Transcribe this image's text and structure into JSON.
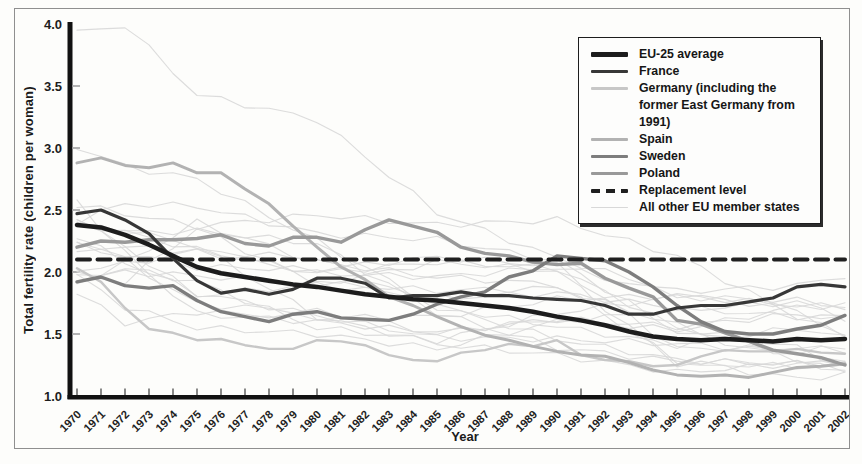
{
  "figure": {
    "background": "#fdfdfb",
    "border_color": "#8f8f8f"
  },
  "chart_data": {
    "type": "line",
    "title": "",
    "xlabel": "Year",
    "ylabel": "Total fertility rate (children per woman)",
    "xlim": [
      1970,
      2002
    ],
    "ylim": [
      1.0,
      4.0
    ],
    "y_ticks": [
      1.0,
      1.5,
      2.0,
      2.5,
      3.0,
      3.5,
      4.0
    ],
    "grid": false,
    "legend_position": "top-right",
    "years": [
      1970,
      1971,
      1972,
      1973,
      1974,
      1975,
      1976,
      1977,
      1978,
      1979,
      1980,
      1981,
      1982,
      1983,
      1984,
      1985,
      1986,
      1987,
      1988,
      1989,
      1990,
      1991,
      1992,
      1993,
      1994,
      1995,
      1996,
      1997,
      1998,
      1999,
      2000,
      2001,
      2002
    ],
    "series": [
      {
        "name": "EU-25 average",
        "color": "#1c1c1c",
        "width": 4.5,
        "values": [
          2.38,
          2.36,
          2.3,
          2.22,
          2.13,
          2.04,
          1.99,
          1.96,
          1.93,
          1.9,
          1.88,
          1.85,
          1.82,
          1.8,
          1.78,
          1.77,
          1.75,
          1.73,
          1.71,
          1.68,
          1.64,
          1.61,
          1.57,
          1.52,
          1.48,
          1.46,
          1.45,
          1.46,
          1.45,
          1.44,
          1.46,
          1.45,
          1.46
        ]
      },
      {
        "name": "France",
        "color": "#373737",
        "width": 3.2,
        "values": [
          2.47,
          2.5,
          2.42,
          2.31,
          2.11,
          1.93,
          1.83,
          1.86,
          1.82,
          1.86,
          1.95,
          1.95,
          1.91,
          1.79,
          1.81,
          1.81,
          1.84,
          1.81,
          1.81,
          1.79,
          1.78,
          1.77,
          1.73,
          1.66,
          1.66,
          1.71,
          1.73,
          1.73,
          1.76,
          1.79,
          1.88,
          1.9,
          1.88
        ]
      },
      {
        "name": "Germany (including the former East Germany from 1991)",
        "color": "#c7c7c7",
        "width": 2.4,
        "values": [
          2.03,
          1.92,
          1.71,
          1.54,
          1.51,
          1.45,
          1.46,
          1.41,
          1.38,
          1.38,
          1.45,
          1.44,
          1.41,
          1.33,
          1.29,
          1.28,
          1.35,
          1.37,
          1.42,
          1.4,
          1.45,
          1.33,
          1.29,
          1.28,
          1.24,
          1.25,
          1.32,
          1.37,
          1.36,
          1.36,
          1.38,
          1.35,
          1.34
        ]
      },
      {
        "name": "Spain",
        "color": "#b2b2b2",
        "width": 3.0,
        "values": [
          2.88,
          2.92,
          2.86,
          2.84,
          2.88,
          2.8,
          2.8,
          2.67,
          2.55,
          2.37,
          2.2,
          2.04,
          1.94,
          1.8,
          1.73,
          1.64,
          1.56,
          1.49,
          1.45,
          1.4,
          1.36,
          1.33,
          1.32,
          1.27,
          1.21,
          1.17,
          1.16,
          1.17,
          1.15,
          1.19,
          1.23,
          1.24,
          1.26
        ]
      },
      {
        "name": "Sweden",
        "color": "#7d7d7d",
        "width": 3.4,
        "values": [
          1.92,
          1.96,
          1.89,
          1.87,
          1.89,
          1.77,
          1.68,
          1.64,
          1.6,
          1.66,
          1.68,
          1.63,
          1.62,
          1.61,
          1.66,
          1.74,
          1.8,
          1.84,
          1.96,
          2.01,
          2.13,
          2.11,
          2.09,
          2.0,
          1.88,
          1.73,
          1.6,
          1.52,
          1.5,
          1.5,
          1.54,
          1.57,
          1.65
        ]
      },
      {
        "name": "Poland",
        "color": "#999999",
        "width": 3.4,
        "values": [
          2.2,
          2.25,
          2.24,
          2.26,
          2.26,
          2.27,
          2.3,
          2.23,
          2.21,
          2.28,
          2.28,
          2.24,
          2.34,
          2.42,
          2.37,
          2.32,
          2.2,
          2.15,
          2.13,
          2.08,
          2.06,
          2.07,
          1.95,
          1.87,
          1.8,
          1.61,
          1.58,
          1.51,
          1.44,
          1.37,
          1.34,
          1.31,
          1.25
        ]
      }
    ],
    "replacement_level": {
      "label": "Replacement level",
      "value": 2.1,
      "color": "#1f1f1f",
      "width": 4,
      "dash": [
        13,
        7.5
      ]
    },
    "other_member_states": {
      "label": "All other EU member states",
      "color": "#d8d8d8",
      "width": 1.1,
      "anchor_years": [
        1970,
        1972,
        1975,
        1980,
        1985,
        1990,
        1995,
        2000,
        2002
      ],
      "lines": [
        [
          3.93,
          3.99,
          3.43,
          3.23,
          2.48,
          2.11,
          1.84,
          1.89,
          1.97
        ],
        [
          2.57,
          2.15,
          1.66,
          1.6,
          1.51,
          1.62,
          1.53,
          1.72,
          1.73
        ],
        [
          2.43,
          2.2,
          1.81,
          1.9,
          1.79,
          1.83,
          1.71,
          1.64,
          1.64
        ],
        [
          2.38,
          2.34,
          2.21,
          1.64,
          1.42,
          1.33,
          1.19,
          1.26,
          1.27
        ],
        [
          2.4,
          2.32,
          2.33,
          2.23,
          1.67,
          1.39,
          1.28,
          1.26,
          1.27
        ],
        [
          3.01,
          2.85,
          2.75,
          2.25,
          1.72,
          1.56,
          1.41,
          1.55,
          1.47
        ],
        [
          1.83,
          1.59,
          1.68,
          1.63,
          1.64,
          1.78,
          1.81,
          1.73,
          1.72
        ],
        [
          1.95,
          2.03,
          1.92,
          1.55,
          1.45,
          1.67,
          1.8,
          1.77,
          1.72
        ],
        [
          2.25,
          2.09,
          1.74,
          1.68,
          1.51,
          1.62,
          1.56,
          1.66,
          1.62
        ],
        [
          2.29,
          2.08,
          1.83,
          1.65,
          1.47,
          1.46,
          1.42,
          1.36,
          1.39
        ],
        [
          1.98,
          1.92,
          2.35,
          1.91,
          1.85,
          1.87,
          1.57,
          1.32,
          1.3
        ],
        [
          1.92,
          2.07,
          2.4,
          2.08,
          1.96,
          1.9,
          1.28,
          1.14,
          1.17
        ],
        [
          2.41,
          2.55,
          2.53,
          2.31,
          2.26,
          2.09,
          1.52,
          1.3,
          1.19
        ],
        [
          1.97,
          1.72,
          1.55,
          1.5,
          1.38,
          1.6,
          1.69,
          1.76,
          1.63
        ],
        [
          2.4,
          2.32,
          2.18,
          1.99,
          2.08,
          2.03,
          1.55,
          1.39,
          1.24
        ],
        [
          1.93,
          2.0,
          1.97,
          1.9,
          2.08,
          2.01,
          1.26,
          1.24,
          1.23
        ],
        [
          2.17,
          2.15,
          2.04,
          2.02,
          2.12,
          2.05,
          1.38,
          1.39,
          1.37
        ],
        [
          2.21,
          2.2,
          2.17,
          2.11,
          1.72,
          1.46,
          1.29,
          1.26,
          1.21
        ],
        [
          2.02,
          2.06,
          2.17,
          1.99,
          1.96,
          2.04,
          1.82,
          1.7,
          1.46
        ],
        [
          2.54,
          2.47,
          2.37,
          2.46,
          2.38,
          2.42,
          2.13,
          1.64,
          1.49
        ]
      ]
    }
  }
}
